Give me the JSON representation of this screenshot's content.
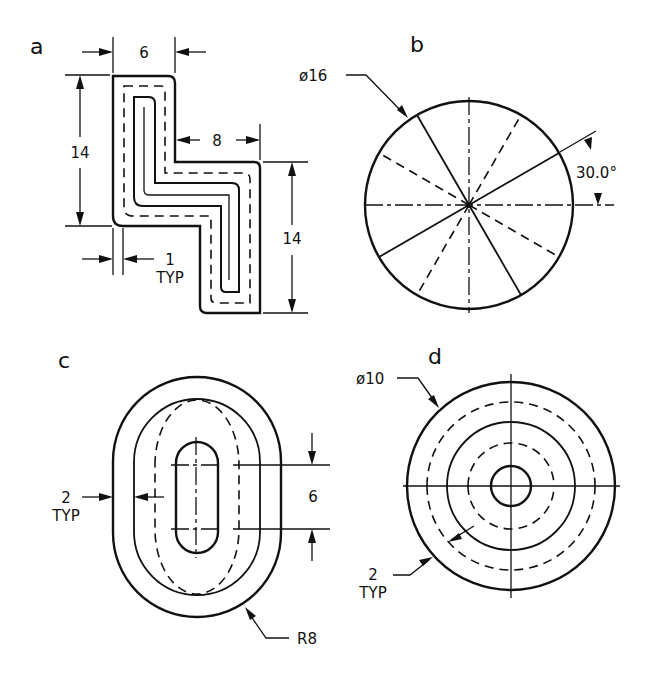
{
  "figure": {
    "panels": [
      {
        "id": "a",
        "label": "a",
        "shape": "Z-shaped section with offset inner profiles",
        "dimensions": {
          "top_width": "6",
          "step_width": "8",
          "left_height": "14",
          "right_height": "14",
          "offset": "1",
          "offset_note": "TYP"
        }
      },
      {
        "id": "b",
        "label": "b",
        "shape": "circle with radial lines",
        "dimensions": {
          "diameter": "ø16",
          "angle": "30.0°"
        }
      },
      {
        "id": "c",
        "label": "c",
        "shape": "obround with concentric offset profiles",
        "dimensions": {
          "offset": "2",
          "offset_note": "TYP",
          "slot_spacing": "6",
          "radius": "R8"
        }
      },
      {
        "id": "d",
        "label": "d",
        "shape": "concentric circles with centerlines",
        "dimensions": {
          "diameter": "ø10",
          "offset": "2",
          "offset_note": "TYP"
        }
      }
    ]
  }
}
